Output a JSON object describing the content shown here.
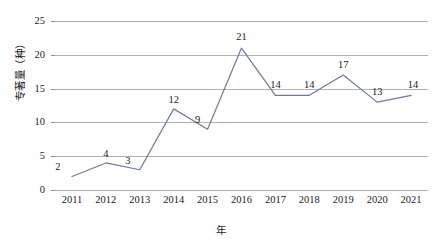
{
  "chart_data": {
    "type": "line",
    "title": "",
    "subtitle": "",
    "xlabel": "年",
    "ylabel": "专著量（种）",
    "categories": [
      "2011",
      "2012",
      "2013",
      "2014",
      "2015",
      "2016",
      "2017",
      "2018",
      "2019",
      "2020",
      "2021"
    ],
    "values": [
      2,
      4,
      3,
      12,
      9,
      21,
      14,
      14,
      17,
      13,
      14
    ],
    "point_labels": [
      "2",
      "4",
      "3",
      "12",
      "9",
      "21",
      "14",
      "14",
      "17",
      "13",
      "14"
    ],
    "series": [
      {
        "name": "专著量（种）",
        "values": [
          2,
          4,
          3,
          12,
          9,
          21,
          14,
          14,
          17,
          13,
          14
        ]
      }
    ],
    "ylim": [
      0,
      25
    ],
    "yticks": [
      0,
      5,
      10,
      15,
      20,
      25
    ],
    "ytick_labels": [
      "0",
      "5",
      "10",
      "15",
      "20",
      "25"
    ],
    "grid": true,
    "grid_axis": "y",
    "legend": false,
    "legend_position": "none",
    "markers": false,
    "line_color": "#6b7a99",
    "grid_color": "#b3b3ad",
    "text_color": "#1a1a1a",
    "background_color": "#ffffff"
  }
}
